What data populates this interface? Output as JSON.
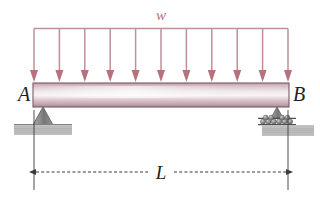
{
  "figure": {
    "kind": "beam-free-body-diagram"
  },
  "labels": {
    "load": "w",
    "support_left": "A",
    "support_right": "B",
    "span": "L"
  },
  "supports": {
    "left": {
      "type": "pin-support",
      "label": "A"
    },
    "right": {
      "type": "roller-support",
      "label": "B"
    }
  },
  "load": {
    "symbol": "w",
    "type": "uniformly-distributed-load",
    "arrow_count": 11,
    "direction": "down"
  },
  "dimension": {
    "symbol": "L",
    "style": "dashed-double-arrow",
    "measures": "A-to-B"
  },
  "colors": {
    "load_line": "#c08f99",
    "load_arrow": "#b8717c",
    "beam_outline": "#7a5a63",
    "beam_light": "#f2eef0",
    "beam_mid": "#cbb2bb",
    "beam_dark": "#a88b95",
    "ground_fill": "#b9b9b9",
    "support_fill": "#8e8e8e",
    "text": "#231f20",
    "dimension_line": "#3a3a3a",
    "background": "#ffffff"
  }
}
